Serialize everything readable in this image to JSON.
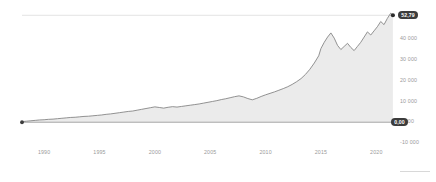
{
  "chart_data": {
    "type": "area",
    "title": "",
    "subtitle": "",
    "xlabel": "",
    "ylabel": "",
    "grid": false,
    "legend": "none",
    "xlim": [
      1988,
      2021.6
    ],
    "ylim": [
      -10000,
      55000
    ],
    "x_ticks": [
      "1990",
      "1995",
      "2000",
      "2005",
      "2010",
      "2015",
      "2020"
    ],
    "x_tick_values": [
      1990,
      1995,
      2000,
      2005,
      2010,
      2015,
      2020
    ],
    "y_ticks": [
      "-10 000",
      "0 000",
      "10 000",
      "20 000",
      "30 000",
      "40 000",
      "50 000"
    ],
    "y_tick_values": [
      -10000,
      0,
      10000,
      20000,
      30000,
      40000,
      50000
    ],
    "series_name": "Price",
    "line_color": "#808080",
    "fill_color": "#ebebeb",
    "baseline_color": "#9e9e9e",
    "annotations": {
      "last_value_label": "52,79",
      "zero_line_label": "0,00",
      "badge_color": "#3c3c3c",
      "start_marker": true,
      "end_marker": true
    },
    "x": [
      1988.0,
      1988.4,
      1988.8,
      1989.2,
      1989.6,
      1990.0,
      1990.4,
      1990.8,
      1991.2,
      1991.6,
      1992.0,
      1992.4,
      1992.8,
      1993.2,
      1993.6,
      1994.0,
      1994.4,
      1994.8,
      1995.2,
      1995.6,
      1996.0,
      1996.4,
      1996.8,
      1997.2,
      1997.6,
      1998.0,
      1998.4,
      1998.8,
      1999.2,
      1999.6,
      2000.0,
      2000.4,
      2000.8,
      2001.2,
      2001.6,
      2002.0,
      2002.4,
      2002.8,
      2003.2,
      2003.6,
      2004.0,
      2004.4,
      2004.8,
      2005.2,
      2005.6,
      2006.0,
      2006.4,
      2006.8,
      2007.2,
      2007.6,
      2008.0,
      2008.4,
      2008.8,
      2009.2,
      2009.6,
      2010.0,
      2010.4,
      2010.8,
      2011.2,
      2011.6,
      2012.0,
      2012.4,
      2012.8,
      2013.2,
      2013.6,
      2014.0,
      2014.4,
      2014.8,
      2015.0,
      2015.3,
      2015.6,
      2015.9,
      2016.2,
      2016.5,
      2016.8,
      2017.1,
      2017.4,
      2017.7,
      2018.0,
      2018.3,
      2018.6,
      2018.9,
      2019.2,
      2019.5,
      2019.8,
      2020.1,
      2020.4,
      2020.7,
      2021.0,
      2021.3,
      2021.5
    ],
    "values": [
      300,
      500,
      700,
      900,
      1100,
      1200,
      1400,
      1500,
      1700,
      1900,
      2100,
      2300,
      2400,
      2600,
      2800,
      2900,
      3100,
      3300,
      3500,
      3800,
      4000,
      4300,
      4600,
      4900,
      5200,
      5400,
      5800,
      6200,
      6600,
      7000,
      7400,
      7100,
      6800,
      7200,
      7500,
      7300,
      7600,
      7900,
      8200,
      8500,
      8800,
      9200,
      9600,
      10000,
      10400,
      10900,
      11300,
      11800,
      12300,
      12700,
      12200,
      11400,
      10800,
      11500,
      12400,
      13200,
      13900,
      14600,
      15400,
      16200,
      17100,
      18200,
      19500,
      21000,
      23000,
      25500,
      28500,
      32000,
      35500,
      38500,
      41000,
      43000,
      40500,
      37000,
      35000,
      36500,
      38000,
      36000,
      34500,
      36500,
      38500,
      41000,
      43500,
      42000,
      44000,
      46000,
      48500,
      47000,
      50000,
      52500,
      51500
    ]
  }
}
